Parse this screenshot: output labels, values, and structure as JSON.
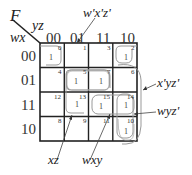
{
  "kmap": {
    "function_label": "F",
    "col_var_label": "yz",
    "row_var_label": "wx",
    "col_headers": [
      "00",
      "01",
      "11",
      "10"
    ],
    "row_headers": [
      "00",
      "01",
      "11",
      "10"
    ],
    "cell_indices": [
      [
        "0",
        "1",
        "3",
        "2"
      ],
      [
        "4",
        "5",
        "7",
        "6"
      ],
      [
        "12",
        "13",
        "15",
        "14"
      ],
      [
        "8",
        "9",
        "11",
        "10"
      ]
    ],
    "ones": [
      {
        "row": 0,
        "col": 0,
        "value": "1",
        "index": "0"
      },
      {
        "row": 0,
        "col": 3,
        "value": "1",
        "index": "2"
      },
      {
        "row": 1,
        "col": 1,
        "value": "1",
        "index": "5"
      },
      {
        "row": 1,
        "col": 2,
        "value": "1",
        "index": "7"
      },
      {
        "row": 2,
        "col": 1,
        "value": "1",
        "index": "13"
      },
      {
        "row": 2,
        "col": 2,
        "value": "1",
        "index": "15"
      },
      {
        "row": 2,
        "col": 3,
        "value": "1",
        "index": "14"
      },
      {
        "row": 3,
        "col": 3,
        "value": "1",
        "index": "10"
      }
    ],
    "groups": [
      {
        "term": "w'x'z'",
        "cells": [
          "0",
          "2"
        ]
      },
      {
        "term": "x'yz'",
        "cells": [
          "2",
          "10"
        ]
      },
      {
        "term": "wyz'",
        "cells": [
          "14",
          "10"
        ]
      },
      {
        "term": "xz",
        "cells": [
          "5",
          "7",
          "13",
          "15"
        ]
      },
      {
        "term": "wxy",
        "cells": [
          "15",
          "14"
        ]
      }
    ]
  }
}
